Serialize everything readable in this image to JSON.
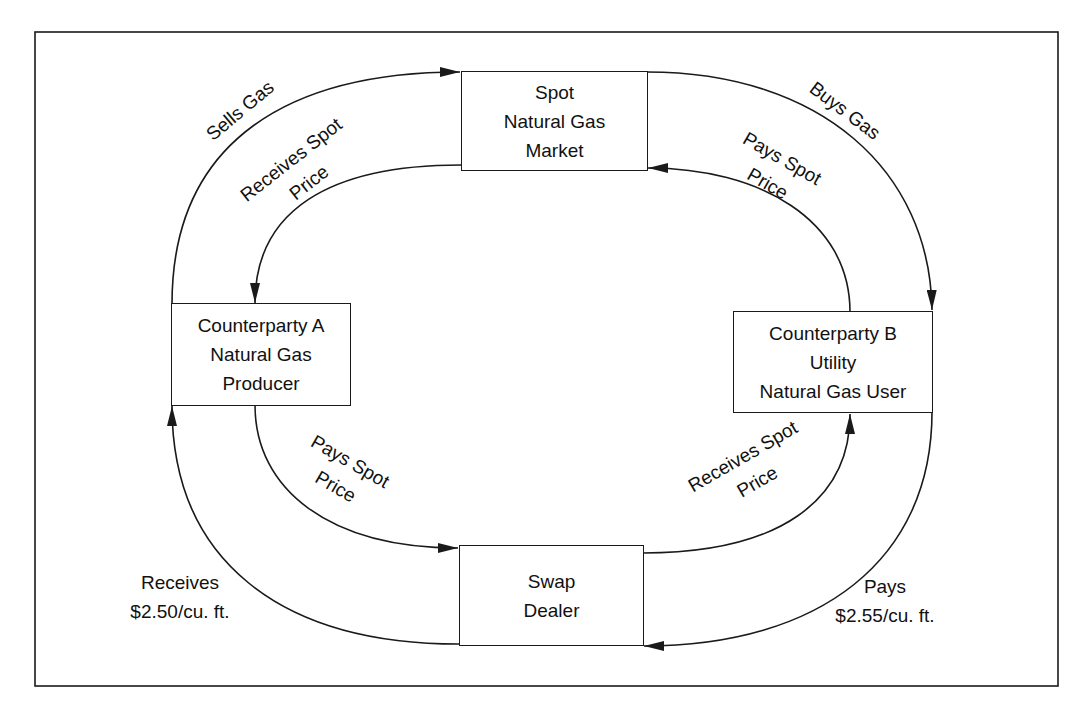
{
  "diagram": {
    "colors": {
      "line": "#1a1a1a",
      "background": "#ffffff"
    },
    "nodes": {
      "spot_market": {
        "lines": [
          "Spot",
          "Natural Gas",
          "Market"
        ]
      },
      "counterparty_a": {
        "lines": [
          "Counterparty A",
          "Natural Gas",
          "Producer"
        ]
      },
      "counterparty_b": {
        "lines": [
          "Counterparty B",
          "Utility",
          "Natural Gas User"
        ]
      },
      "swap_dealer": {
        "lines": [
          "Swap",
          "Dealer"
        ]
      }
    },
    "edges": {
      "a_sells_gas": {
        "from": "counterparty_a",
        "to": "spot_market",
        "label": "Sells Gas"
      },
      "market_pays_a": {
        "from": "spot_market",
        "to": "counterparty_a",
        "lines": [
          "Receives Spot",
          "Price"
        ]
      },
      "b_buys_gas": {
        "from": "spot_market",
        "to": "counterparty_b",
        "label": "Buys Gas"
      },
      "b_pays_market": {
        "from": "counterparty_b",
        "to": "spot_market",
        "lines": [
          "Pays Spot",
          "Price"
        ]
      },
      "a_pays_dealer": {
        "from": "counterparty_a",
        "to": "swap_dealer",
        "lines": [
          "Pays Spot",
          "Price"
        ]
      },
      "dealer_pays_b": {
        "from": "swap_dealer",
        "to": "counterparty_b",
        "lines": [
          "Receives Spot",
          "Price"
        ]
      },
      "dealer_pays_a": {
        "from": "swap_dealer",
        "to": "counterparty_a",
        "lines": [
          "Receives",
          "$2.50/cu. ft."
        ]
      },
      "b_pays_dealer": {
        "from": "counterparty_b",
        "to": "swap_dealer",
        "lines": [
          "Pays",
          "$2.55/cu. ft."
        ]
      }
    }
  }
}
